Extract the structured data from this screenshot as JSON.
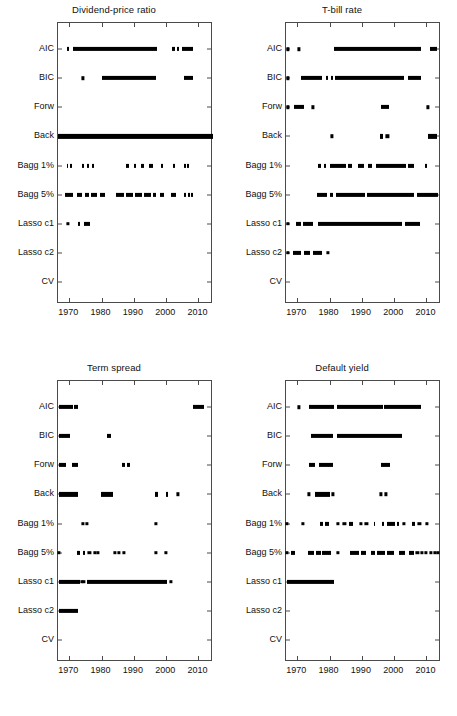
{
  "figure": {
    "panel_order": [
      "dividend_price_ratio",
      "tbill_rate",
      "term_spread",
      "default_yield"
    ]
  },
  "axis": {
    "categories": [
      "AIC",
      "BIC",
      "Forw",
      "Back",
      "Bagg 1%",
      "Bagg 5%",
      "Lasso c1",
      "Lasso c2",
      "CV"
    ],
    "xticks": [
      1970,
      1980,
      1990,
      2000,
      2010
    ],
    "xtick_labels": [
      "1970",
      "1980",
      "1990",
      "2000",
      "2010"
    ],
    "xlim": [
      1966.5,
      2014.5
    ],
    "marker": "asterisk-dot",
    "marker_color": "#000000",
    "axis_color": "#4a4a4a",
    "grid": false
  },
  "chart_data": [
    {
      "type": "scatter",
      "title": "Dividend-price ratio",
      "xlabel": "",
      "ylabel": "",
      "xlim": [
        1966.5,
        2014.5
      ],
      "categories": [
        "AIC",
        "BIC",
        "Forw",
        "Back",
        "Bagg 1%",
        "Bagg 5%",
        "Lasso c1",
        "Lasso c2",
        "CV"
      ],
      "series": [
        {
          "name": "AIC",
          "segments": [
            [
              1969.3,
              1969.8
            ],
            [
              1971.0,
              1997.2
            ],
            [
              2001.9,
              2002.6
            ],
            [
              2003.4,
              2003.9
            ],
            [
              2005.0,
              2008.2
            ]
          ],
          "points": []
        },
        {
          "name": "BIC",
          "segments": [
            [
              1980.0,
              1997.0
            ],
            [
              2005.6,
              2008.2
            ]
          ],
          "points": [
            1974.2
          ]
        },
        {
          "name": "Forw",
          "segments": [],
          "points": []
        },
        {
          "name": "Back",
          "segments": [
            [
              1966.6,
              2014.4
            ]
          ],
          "points": []
        },
        {
          "name": "Bagg 1%",
          "segments": [
            [
              1969.2,
              1969.7
            ],
            [
              1970.3,
              1970.8
            ],
            [
              1974.0,
              1974.5
            ],
            [
              1975.5,
              1976.0
            ],
            [
              1976.9,
              1977.6
            ],
            [
              1987.6,
              1988.4
            ],
            [
              1990.0,
              1990.8
            ],
            [
              1992.3,
              1993.0
            ],
            [
              1994.6,
              1995.8
            ],
            [
              1998.4,
              1999.1
            ],
            [
              2002.1,
              2002.8
            ],
            [
              2005.6,
              2006.2
            ],
            [
              2006.6,
              2007.2
            ]
          ],
          "points": []
        },
        {
          "name": "Bagg 5%",
          "segments": [
            [
              1968.6,
              1971.2
            ],
            [
              1972.4,
              1974.0
            ],
            [
              1974.8,
              1976.2
            ],
            [
              1976.8,
              1978.6
            ],
            [
              1979.4,
              1981.2
            ],
            [
              1984.6,
              1987.0
            ],
            [
              1987.6,
              1989.6
            ],
            [
              1990.3,
              1992.4
            ],
            [
              1993.0,
              1995.2
            ],
            [
              1995.8,
              1996.9
            ],
            [
              1998.2,
              1999.4
            ],
            [
              2001.6,
              2002.9
            ],
            [
              2005.4,
              2006.2
            ],
            [
              2006.7,
              2007.3
            ],
            [
              2007.8,
              2008.3
            ]
          ],
          "points": []
        },
        {
          "name": "Lasso c1",
          "segments": [
            [
              1972.8,
              1973.4
            ],
            [
              1974.6,
              1976.4
            ]
          ],
          "points": [
            1969.6
          ]
        },
        {
          "name": "Lasso c2",
          "segments": [],
          "points": []
        },
        {
          "name": "CV",
          "segments": [],
          "points": []
        }
      ]
    },
    {
      "type": "scatter",
      "title": "T-bill rate",
      "xlabel": "",
      "ylabel": "",
      "xlim": [
        1966.5,
        2014.5
      ],
      "categories": [
        "AIC",
        "BIC",
        "Forw",
        "Back",
        "Bagg 1%",
        "Bagg 5%",
        "Lasso c1",
        "Lasso c2",
        "CV"
      ],
      "series": [
        {
          "name": "AIC",
          "segments": [
            [
              1981.5,
              2008.2
            ],
            [
              2011.2,
              2013.3
            ]
          ],
          "points": [
            1967.0,
            1970.6
          ]
        },
        {
          "name": "BIC",
          "segments": [
            [
              1971.2,
              1977.8
            ],
            [
              1979.0,
              1979.6
            ],
            [
              1980.4,
              1981.1
            ],
            [
              1981.8,
              2002.9
            ],
            [
              2004.2,
              2008.2
            ]
          ],
          "points": [
            1967.0
          ]
        },
        {
          "name": "Forw",
          "segments": [
            [
              1969.0,
              1972.2
            ],
            [
              1995.8,
              1998.4
            ]
          ],
          "points": [
            1967.0,
            1974.8,
            2010.4
          ]
        },
        {
          "name": "Back",
          "segments": [
            [
              1995.6,
              1996.4
            ],
            [
              2010.6,
              2013.4
            ]
          ],
          "points": [
            1980.6,
            1997.9
          ]
        },
        {
          "name": "Bagg 1%",
          "segments": [
            [
              1976.4,
              1977.2
            ],
            [
              1978.3,
              1978.9
            ],
            [
              1980.2,
              1985.0
            ],
            [
              1985.8,
              1987.0
            ],
            [
              1988.8,
              1990.6
            ],
            [
              1992.0,
              1993.0
            ],
            [
              1994.4,
              2003.6
            ],
            [
              2004.4,
              2006.1
            ],
            [
              2009.4,
              2010.2
            ]
          ],
          "points": []
        },
        {
          "name": "Bagg 5%",
          "segments": [
            [
              1976.2,
              1979.2
            ],
            [
              1980.0,
              1981.0
            ],
            [
              1982.0,
              1991.0
            ],
            [
              1991.6,
              2006.0
            ],
            [
              2007.0,
              2013.6
            ]
          ],
          "points": []
        },
        {
          "name": "Lasso c1",
          "segments": [
            [
              1969.5,
              1971.2
            ],
            [
              1971.8,
              1975.0
            ],
            [
              1976.4,
              2002.3
            ],
            [
              2003.2,
              2007.9
            ]
          ],
          "points": [
            1967.0
          ]
        },
        {
          "name": "Lasso c2",
          "segments": [
            [
              1968.8,
              1971.2
            ],
            [
              1972.2,
              1974.0
            ],
            [
              1974.8,
              1977.8
            ]
          ],
          "points": [
            1967.0,
            1979.4
          ]
        },
        {
          "name": "CV",
          "segments": [],
          "points": []
        }
      ]
    },
    {
      "type": "scatter",
      "title": "Term spread",
      "xlabel": "",
      "ylabel": "",
      "xlim": [
        1966.5,
        2014.5
      ],
      "categories": [
        "AIC",
        "BIC",
        "Forw",
        "Back",
        "Bagg 1%",
        "Bagg 5%",
        "Lasso c1",
        "Lasso c2",
        "CV"
      ],
      "series": [
        {
          "name": "AIC",
          "segments": [
            [
              1966.8,
              1971.0
            ],
            [
              1971.6,
              1972.6
            ],
            [
              2008.2,
              2011.6
            ]
          ],
          "points": []
        },
        {
          "name": "BIC",
          "segments": [
            [
              1966.8,
              1970.3
            ],
            [
              1981.6,
              1982.8
            ]
          ],
          "points": []
        },
        {
          "name": "Forw",
          "segments": [
            [
              1966.8,
              1969.0
            ],
            [
              1970.8,
              1972.6
            ],
            [
              1986.2,
              1987.2
            ],
            [
              1988.0,
              1988.8
            ]
          ],
          "points": []
        },
        {
          "name": "Back",
          "segments": [
            [
              1966.8,
              1972.8
            ],
            [
              1979.8,
              1983.4
            ],
            [
              1996.6,
              1997.4
            ],
            [
              1999.8,
              2000.6
            ]
          ],
          "points": [
            2003.6
          ]
        },
        {
          "name": "Bagg 1%",
          "segments": [],
          "points": [
            1974.2,
            1975.4,
            1996.9
          ]
        },
        {
          "name": "Bagg 5%",
          "segments": [
            [
              1972.4,
              1973.2
            ],
            [
              1974.2,
              1974.8
            ]
          ],
          "points": [
            1966.9,
            1976.2,
            1978.0,
            1978.9,
            1984.0,
            1985.4,
            1987.0,
            1996.8,
            1999.8
          ]
        },
        {
          "name": "Lasso c1",
          "segments": [
            [
              1966.7,
              1973.2
            ],
            [
              1975.6,
              2000.2
            ]
          ],
          "points": [
            1974.0,
            1974.6,
            2001.4
          ]
        },
        {
          "name": "Lasso c2",
          "segments": [
            [
              1966.8,
              1972.6
            ]
          ],
          "points": []
        },
        {
          "name": "CV",
          "segments": [],
          "points": []
        }
      ]
    },
    {
      "type": "scatter",
      "title": "Default yield",
      "xlabel": "",
      "ylabel": "",
      "xlim": [
        1966.5,
        2014.5
      ],
      "categories": [
        "AIC",
        "BIC",
        "Forw",
        "Back",
        "Bagg 1%",
        "Bagg 5%",
        "Lasso c1",
        "Lasso c2",
        "CV"
      ],
      "series": [
        {
          "name": "AIC",
          "segments": [
            [
              1973.6,
              1981.4
            ],
            [
              1982.2,
              1996.4
            ],
            [
              1997.0,
              2008.4
            ]
          ],
          "points": [
            1970.6
          ]
        },
        {
          "name": "BIC",
          "segments": [
            [
              1974.2,
              1981.2
            ],
            [
              1982.4,
              2002.4
            ]
          ],
          "points": []
        },
        {
          "name": "Forw",
          "segments": [
            [
              1973.6,
              1975.6
            ],
            [
              1976.6,
              1981.0
            ],
            [
              1995.8,
              1998.8
            ]
          ],
          "points": []
        },
        {
          "name": "Back",
          "segments": [
            [
              1975.4,
              1980.2
            ]
          ],
          "points": [
            1973.6,
            1981.0,
            1995.8,
            1997.4
          ]
        },
        {
          "name": "Bagg 1%",
          "segments": [
            [
              1977.0,
              1977.9
            ],
            [
              1978.6,
              1979.8
            ],
            [
              1986.0,
              1987.2
            ],
            [
              1993.6,
              1994.2
            ],
            [
              1996.2,
              1997.0
            ],
            [
              1997.8,
              2000.2
            ],
            [
              2000.8,
              2001.6
            ],
            [
              2005.4,
              2006.6
            ]
          ],
          "points": [
            1966.9,
            1971.8,
            1982.6,
            1984.6,
            1989.8,
            1991.4,
            2003.0,
            2007.8,
            2010.2
          ]
        },
        {
          "name": "Bagg 5%",
          "segments": [
            [
              1968.0,
              1969.2
            ],
            [
              1973.4,
              1975.2
            ],
            [
              1975.8,
              1977.4
            ],
            [
              1977.8,
              1980.4
            ],
            [
              1986.2,
              1989.0
            ],
            [
              1989.8,
              1991.2
            ],
            [
              1992.8,
              1994.0
            ],
            [
              1994.6,
              1997.2
            ],
            [
              1997.8,
              1999.8
            ],
            [
              2001.6,
              2003.4
            ],
            [
              2004.6,
              2006.0
            ]
          ],
          "points": [
            1966.9,
            1982.6,
            2007.2,
            2008.6,
            2009.8,
            2011.4,
            2012.6,
            2013.6
          ]
        },
        {
          "name": "Lasso c1",
          "segments": [
            [
              1966.8,
              1981.4
            ]
          ],
          "points": []
        },
        {
          "name": "Lasso c2",
          "segments": [],
          "points": []
        },
        {
          "name": "CV",
          "segments": [],
          "points": []
        }
      ]
    }
  ]
}
